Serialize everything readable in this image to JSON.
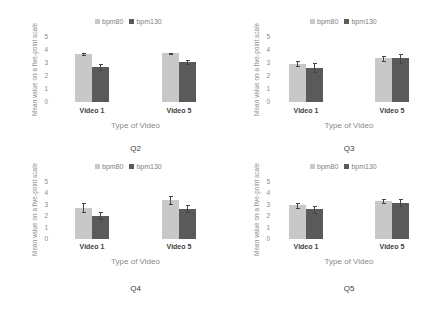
{
  "chart_data": [
    {
      "type": "bar",
      "title": "Q2",
      "xlabel": "Type of Video",
      "ylabel": "Mean value on a five-point scale",
      "categories": [
        "Video 1",
        "Video 5"
      ],
      "yticks": [
        "0",
        "1",
        "2",
        "3",
        "4",
        "5"
      ],
      "ylim": [
        0,
        5
      ],
      "legend_position": "top",
      "grid": false,
      "series": [
        {
          "name": "bpm80",
          "values": [
            3.7,
            3.75
          ],
          "errors": [
            0.05,
            0.05
          ],
          "color": "#c8c8c8"
        },
        {
          "name": "bpm130",
          "values": [
            2.7,
            3.1
          ],
          "errors": [
            0.2,
            0.15
          ],
          "color": "#5a5a5a"
        }
      ]
    },
    {
      "type": "bar",
      "title": "Q3",
      "xlabel": "Type of Video",
      "ylabel": "Mean value on a five-point scale",
      "categories": [
        "Video 1",
        "Video 5"
      ],
      "yticks": [
        "0",
        "1",
        "2",
        "3",
        "4",
        "5"
      ],
      "ylim": [
        0,
        5
      ],
      "legend_position": "top",
      "grid": false,
      "series": [
        {
          "name": "bpm80",
          "values": [
            2.95,
            3.35
          ],
          "errors": [
            0.2,
            0.2
          ],
          "color": "#c8c8c8"
        },
        {
          "name": "bpm130",
          "values": [
            2.65,
            3.35
          ],
          "errors": [
            0.35,
            0.35
          ],
          "color": "#5a5a5a"
        }
      ]
    },
    {
      "type": "bar",
      "title": "Q4",
      "xlabel": "Type of Video",
      "ylabel": "Mean value on a five-point scale",
      "categories": [
        "Video 1",
        "Video 5"
      ],
      "yticks": [
        "0",
        "1",
        "2",
        "3",
        "4",
        "5"
      ],
      "ylim": [
        0,
        5
      ],
      "legend_position": "top",
      "grid": false,
      "series": [
        {
          "name": "bpm80",
          "values": [
            2.75,
            3.45
          ],
          "errors": [
            0.4,
            0.35
          ],
          "color": "#c8c8c8"
        },
        {
          "name": "bpm130",
          "values": [
            2.05,
            2.65
          ],
          "errors": [
            0.3,
            0.3
          ],
          "color": "#5a5a5a"
        }
      ]
    },
    {
      "type": "bar",
      "title": "Q5",
      "xlabel": "Type of Video",
      "ylabel": "Mean value on a five-point scale",
      "categories": [
        "Video 1",
        "Video 5"
      ],
      "yticks": [
        "0",
        "1",
        "2",
        "3",
        "4",
        "5"
      ],
      "ylim": [
        0,
        5
      ],
      "legend_position": "top",
      "grid": false,
      "series": [
        {
          "name": "bpm80",
          "values": [
            2.95,
            3.35
          ],
          "errors": [
            0.2,
            0.2
          ],
          "color": "#c8c8c8"
        },
        {
          "name": "bpm130",
          "values": [
            2.6,
            3.2
          ],
          "errors": [
            0.3,
            0.3
          ],
          "color": "#5a5a5a"
        }
      ]
    }
  ]
}
